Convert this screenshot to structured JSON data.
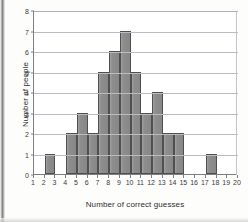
{
  "chart_data": {
    "type": "bar",
    "title": "",
    "xlabel": "Number of correct guesses",
    "ylabel": "Number of people",
    "xlim": [
      1,
      20
    ],
    "ylim": [
      0,
      8
    ],
    "grid": true,
    "legend": "none",
    "bin_width": 1,
    "xticks": [
      "1",
      "2",
      "3",
      "4",
      "5",
      "6",
      "7",
      "8",
      "9",
      "10",
      "11",
      "12",
      "13",
      "14",
      "15",
      "16",
      "17",
      "18",
      "19",
      "20"
    ],
    "yticks": [
      "0",
      "1",
      "2",
      "3",
      "4",
      "5",
      "6",
      "7",
      "8"
    ],
    "categories": [
      "1-2",
      "2-3",
      "3-4",
      "4-5",
      "5-6",
      "6-7",
      "7-8",
      "8-9",
      "9-10",
      "10-11",
      "11-12",
      "12-13",
      "13-14",
      "14-15",
      "15-16",
      "16-17",
      "17-18",
      "18-19",
      "19-20"
    ],
    "bin_starts": [
      1,
      2,
      3,
      4,
      5,
      6,
      7,
      8,
      9,
      10,
      11,
      12,
      13,
      14,
      15,
      16,
      17,
      18,
      19
    ],
    "values": [
      0,
      1,
      0,
      2,
      3,
      2,
      5,
      6,
      7,
      5,
      3,
      4,
      2,
      2,
      0,
      0,
      1,
      0,
      0
    ]
  },
  "colors": {
    "bar_fill": "#8e8e8e",
    "bar_stroke": "#4f4f50",
    "axis": "#7d7f86",
    "grid": "#b9bcc4",
    "text": "#2e2e2e",
    "background": "#fdfdfc"
  }
}
